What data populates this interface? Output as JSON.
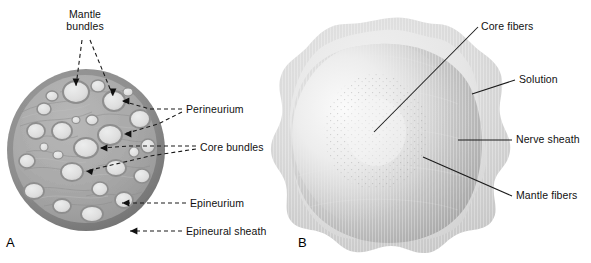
{
  "figure": {
    "type": "anatomical-diagram"
  },
  "panels": [
    {
      "letter": "A",
      "name": "nerve-cross-section",
      "labels": [
        {
          "id": "mantle-bundles",
          "text": "Mantle\nbundles",
          "line1": "Mantle",
          "line2": "bundles",
          "leader": "dashed-double-arrow"
        },
        {
          "id": "perineurium",
          "text": "Perineurium",
          "leader": "dashed-double-arrow"
        },
        {
          "id": "core-bundles",
          "text": "Core bundles",
          "leader": "dashed-double-arrow"
        },
        {
          "id": "epineurium",
          "text": "Epineurium",
          "leader": "dashed-arrow"
        },
        {
          "id": "epineural-sheath",
          "text": "Epineural sheath",
          "leader": "dashed-arrow"
        }
      ]
    },
    {
      "letter": "B",
      "name": "nerve-in-solution",
      "labels": [
        {
          "id": "core-fibers",
          "text": "Core fibers",
          "leader": "solid-line"
        },
        {
          "id": "solution",
          "text": "Solution",
          "leader": "solid-line"
        },
        {
          "id": "nerve-sheath",
          "text": "Nerve sheath",
          "leader": "solid-line"
        },
        {
          "id": "mantle-fibers",
          "text": "Mantle fibers",
          "leader": "solid-line"
        }
      ]
    }
  ],
  "colors": {
    "background": "#ffffff",
    "text": "#111111",
    "leader_line": "#1a1a1a",
    "epineural_sheath": "#8d8d8d",
    "epineurium": "#a8a8a8",
    "fascicle_fill": "#dcdcdc",
    "perineurium_ring": "#9a9a9a",
    "solution_outer": "#d9d9d9",
    "nerve_sheath": "#e4e4e4",
    "mantle_fibers": "#b9b9b9",
    "core_fibers": "#efefef"
  }
}
